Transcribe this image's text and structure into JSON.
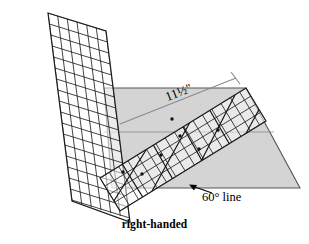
{
  "figure": {
    "title_caption": "right-handed",
    "annotations": {
      "dimension_label": "11½\"",
      "angle_label": "60° line"
    },
    "colors": {
      "fabric_gray": "#d4d4d4",
      "fabric_edge": "#555555",
      "ruler_line": "#1a1a1a",
      "ruler_fill": "#ffffff",
      "dimension_line": "#888888",
      "background": "#ffffff",
      "text": "#000000"
    },
    "elements": {
      "fabric_name": "gray fabric strip",
      "ruler_left_name": "left tilted quilting ruler",
      "ruler_right_name": "right tilted quilting ruler",
      "dimension_line_name": "11 1/2 inch dimension line",
      "angle_arrow_name": "60 degree line pointer arrow"
    },
    "geometry": {
      "fabric_points": "104,88 246,88 300,188 112,188",
      "ruler_left_quad": "48,13 106,31 130,222 72,201",
      "ruler_right_quad": "100,178 246,88 266,121 120,211",
      "dimension_line": "120,124 236,78",
      "arrow_from": "212,192",
      "arrow_to": "190,186",
      "ruler_grid_step_px": 11,
      "ruler_diagonal_angle_deg": 60
    }
  }
}
